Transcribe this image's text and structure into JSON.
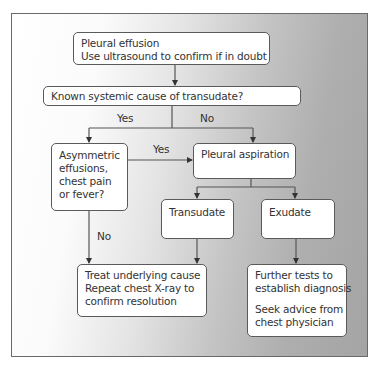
{
  "diagram": {
    "type": "flowchart",
    "nodes": {
      "start": {
        "lines": [
          "Pleural effusion",
          "Use ultrasound to confirm if in doubt"
        ]
      },
      "known_cause": {
        "lines": [
          "Known systemic cause of transudate?"
        ]
      },
      "asymmetric": {
        "lines": [
          "Asymmetric",
          "effusions,",
          "chest pain",
          "or fever?"
        ]
      },
      "aspiration": {
        "lines": [
          "Pleural aspiration"
        ]
      },
      "transudate": {
        "lines": [
          "Transudate"
        ]
      },
      "exudate": {
        "lines": [
          "Exudate"
        ]
      },
      "treat": {
        "lines": [
          "Treat underlying cause",
          "Repeat chest X-ray to",
          "confirm resolution"
        ]
      },
      "further": {
        "lines": [
          "Further tests to",
          "establish diagnosis",
          "",
          "Seek advice from",
          "chest physician"
        ]
      }
    },
    "edge_labels": {
      "known_yes": "Yes",
      "known_no": "No",
      "asym_yes": "Yes",
      "asym_no": "No"
    },
    "edges": [
      {
        "from": "start",
        "to": "known_cause"
      },
      {
        "from": "known_cause",
        "to": "asymmetric",
        "label": "Yes"
      },
      {
        "from": "known_cause",
        "to": "aspiration",
        "label": "No"
      },
      {
        "from": "asymmetric",
        "to": "aspiration",
        "label": "Yes"
      },
      {
        "from": "asymmetric",
        "to": "treat",
        "label": "No"
      },
      {
        "from": "aspiration",
        "to": "transudate"
      },
      {
        "from": "aspiration",
        "to": "exudate"
      },
      {
        "from": "transudate",
        "to": "treat"
      },
      {
        "from": "exudate",
        "to": "further"
      }
    ]
  }
}
